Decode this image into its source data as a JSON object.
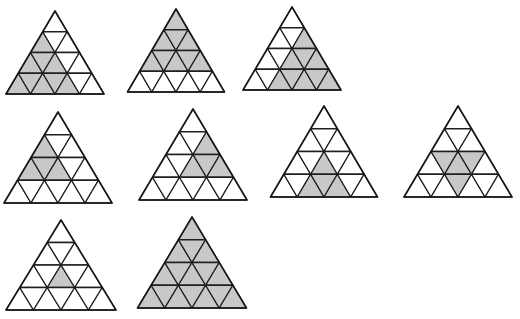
{
  "figure": {
    "colors": {
      "shaded": "#c8c8c8",
      "unshaded": "#ffffff",
      "line": "#1f1f1f"
    },
    "grid_rows": 4,
    "cell_indexing": "row r (0=top) has 2r+1 cells indexed left-to-right; even index = upward triangle, odd index = downward triangle",
    "triangles": [
      {
        "id": "t1",
        "apex": [
          55,
          11
        ],
        "base_y": 94,
        "base_left": 7,
        "base_right": 105,
        "shaded": [
          [
            1,
            0
          ],
          [
            2,
            0
          ],
          [
            2,
            1
          ],
          [
            2,
            2
          ],
          [
            3,
            0
          ],
          [
            3,
            1
          ],
          [
            3,
            2
          ],
          [
            3,
            3
          ],
          [
            3,
            4
          ]
        ]
      },
      {
        "id": "t2",
        "apex": [
          176,
          9
        ],
        "base_y": 92,
        "base_left": 128,
        "base_right": 225,
        "shaded": [
          [
            0,
            0
          ],
          [
            1,
            0
          ],
          [
            1,
            1
          ],
          [
            1,
            2
          ],
          [
            2,
            0
          ],
          [
            2,
            1
          ],
          [
            2,
            2
          ],
          [
            2,
            3
          ],
          [
            2,
            4
          ]
        ]
      },
      {
        "id": "t3",
        "apex": [
          292,
          7
        ],
        "base_y": 90,
        "base_left": 243,
        "base_right": 341,
        "shaded": [
          [
            1,
            2
          ],
          [
            2,
            2
          ],
          [
            2,
            3
          ],
          [
            2,
            4
          ],
          [
            3,
            2
          ],
          [
            3,
            3
          ],
          [
            3,
            4
          ],
          [
            3,
            5
          ],
          [
            3,
            6
          ]
        ]
      },
      {
        "id": "t4",
        "apex": [
          58,
          112
        ],
        "base_y": 203,
        "base_left": 4,
        "base_right": 112,
        "shaded": [
          [
            1,
            0
          ],
          [
            2,
            0
          ],
          [
            2,
            1
          ],
          [
            2,
            2
          ]
        ]
      },
      {
        "id": "t5",
        "apex": [
          193,
          109
        ],
        "base_y": 200,
        "base_left": 140,
        "base_right": 248,
        "shaded": [
          [
            1,
            2
          ],
          [
            2,
            2
          ],
          [
            2,
            3
          ],
          [
            2,
            4
          ]
        ]
      },
      {
        "id": "t6",
        "apex": [
          324,
          106
        ],
        "base_y": 197,
        "base_left": 271,
        "base_right": 378,
        "shaded": [
          [
            2,
            2
          ],
          [
            3,
            2
          ],
          [
            3,
            3
          ],
          [
            3,
            4
          ]
        ]
      },
      {
        "id": "t7",
        "apex": [
          458,
          106
        ],
        "base_y": 197,
        "base_left": 404,
        "base_right": 512,
        "shaded": [
          [
            2,
            1
          ],
          [
            2,
            2
          ],
          [
            2,
            3
          ],
          [
            3,
            3
          ]
        ]
      },
      {
        "id": "t8",
        "apex": [
          61,
          220
        ],
        "base_y": 310,
        "base_left": 7,
        "base_right": 117,
        "shaded": [
          [
            2,
            2
          ]
        ]
      },
      {
        "id": "t9",
        "apex": [
          192,
          217
        ],
        "base_y": 308,
        "base_left": 138,
        "base_right": 247,
        "shaded": "all"
      }
    ]
  }
}
